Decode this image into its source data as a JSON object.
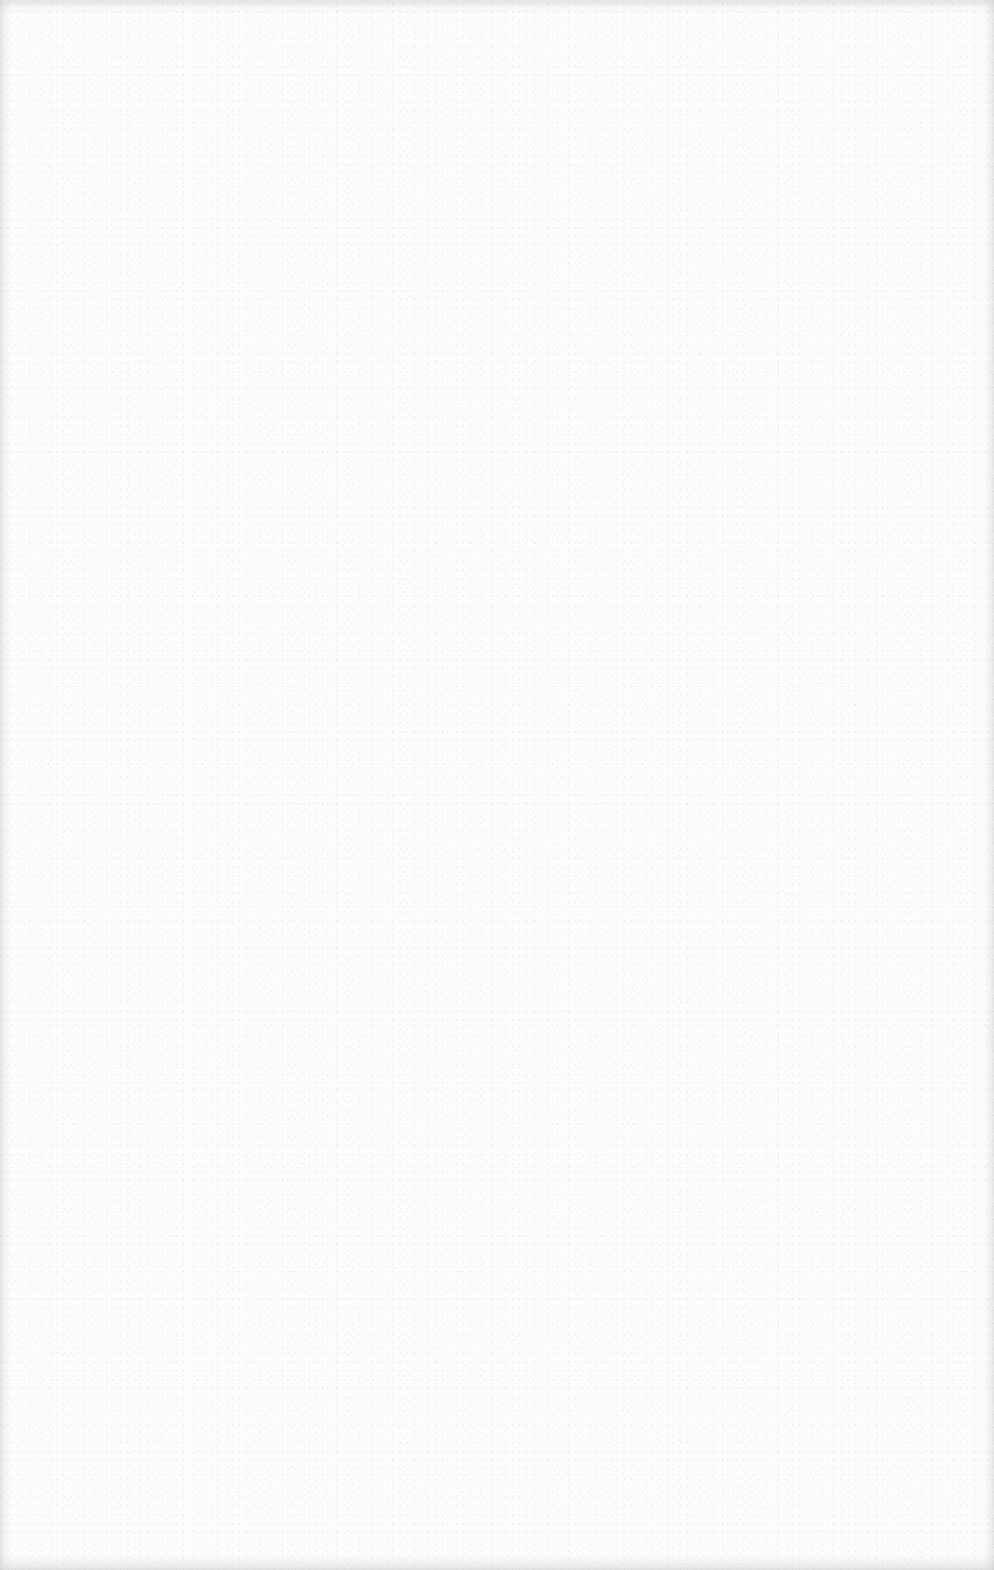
{
  "page": {
    "kind": "blank-sheet",
    "background_color": "#fdfdfd",
    "edge_shade_color": "#e6e6e6",
    "content": []
  }
}
